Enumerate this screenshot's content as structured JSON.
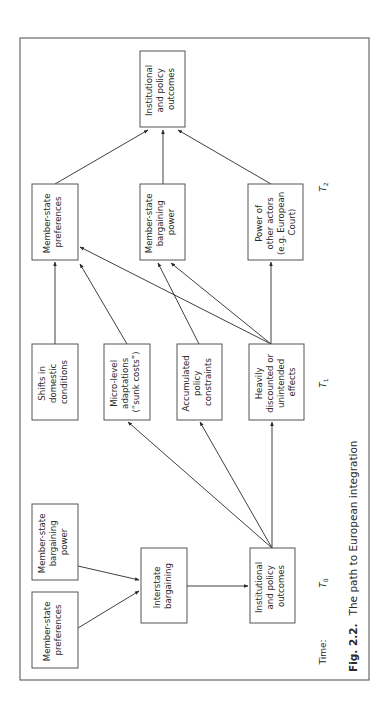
{
  "figure": {
    "number": "Fig. 2.2.",
    "title": "The path to European integration",
    "orientation": "rotated 90° counter-clockwise"
  },
  "time_axis": {
    "caption": "Time:",
    "periods": [
      {
        "id": "t0",
        "label": "T",
        "sub": "0"
      },
      {
        "id": "t1",
        "label": "T",
        "sub": "1"
      },
      {
        "id": "t2",
        "label": "T",
        "sub": "2"
      }
    ]
  },
  "nodes": {
    "t0_preferences": {
      "lines": [
        "Member-state",
        "preferences"
      ]
    },
    "t0_bargaining_power": {
      "lines": [
        "Member-state",
        "bargaining",
        "power"
      ]
    },
    "t0_interstate_bargaining": {
      "lines": [
        "Interstate",
        "bargaining"
      ]
    },
    "t0_outcomes": {
      "lines": [
        "Institutional",
        "and policy",
        "outcomes"
      ]
    },
    "t1_domestic_shifts": {
      "lines": [
        "Shifts in",
        "domestic",
        "conditions"
      ]
    },
    "t1_micro_adaptations": {
      "lines": [
        "Micro-level",
        "adaptations",
        "(“sunk costs”)"
      ]
    },
    "t1_policy_constraints": {
      "lines": [
        "Accumulated",
        "policy",
        "constraints"
      ]
    },
    "t1_unintended_effects": {
      "lines": [
        "Heavily",
        "discounted or",
        "unintended",
        "effects"
      ]
    },
    "t2_preferences": {
      "lines": [
        "Member-state",
        "preferences"
      ]
    },
    "t2_bargaining_power": {
      "lines": [
        "Member-state",
        "bargaining",
        "power"
      ]
    },
    "t2_other_actors": {
      "lines": [
        "Power of",
        "other actors",
        "(e.g. European",
        "Court)"
      ]
    },
    "final_outcomes": {
      "lines": [
        "Institutional",
        "and policy",
        "outcomes"
      ]
    }
  },
  "edges": [
    {
      "from": "t0_bargaining_power",
      "to": "t0_interstate_bargaining"
    },
    {
      "from": "t0_preferences",
      "to": "t0_interstate_bargaining"
    },
    {
      "from": "t0_interstate_bargaining",
      "to": "t0_outcomes"
    },
    {
      "from": "t0_outcomes",
      "to": "t1_micro_adaptations"
    },
    {
      "from": "t0_outcomes",
      "to": "t1_policy_constraints"
    },
    {
      "from": "t0_outcomes",
      "to": "t1_unintended_effects"
    },
    {
      "from": "t1_domestic_shifts",
      "to": "t2_preferences"
    },
    {
      "from": "t1_micro_adaptations",
      "to": "t2_preferences"
    },
    {
      "from": "t1_policy_constraints",
      "to": "t2_bargaining_power"
    },
    {
      "from": "t1_unintended_effects",
      "to": "t2_preferences"
    },
    {
      "from": "t1_unintended_effects",
      "to": "t2_bargaining_power"
    },
    {
      "from": "t1_unintended_effects",
      "to": "t2_other_actors"
    },
    {
      "from": "t2_preferences",
      "to": "final_outcomes"
    },
    {
      "from": "t2_bargaining_power",
      "to": "final_outcomes"
    },
    {
      "from": "t2_other_actors",
      "to": "final_outcomes"
    }
  ],
  "colors": {
    "frame": "#6a6a6a",
    "box_border": "#555555",
    "text": "#2a2a2a",
    "background": "#ffffff"
  }
}
